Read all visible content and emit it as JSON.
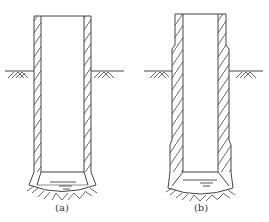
{
  "figure": {
    "panels": [
      {
        "id": "a",
        "label": "(a)",
        "form": "straight-wall shaft with belled bottom"
      },
      {
        "id": "b",
        "label": "(b)",
        "form": "stepped-wall shaft with belled bottom"
      }
    ],
    "colors": {
      "line": "#444444",
      "background": "#ffffff"
    }
  }
}
